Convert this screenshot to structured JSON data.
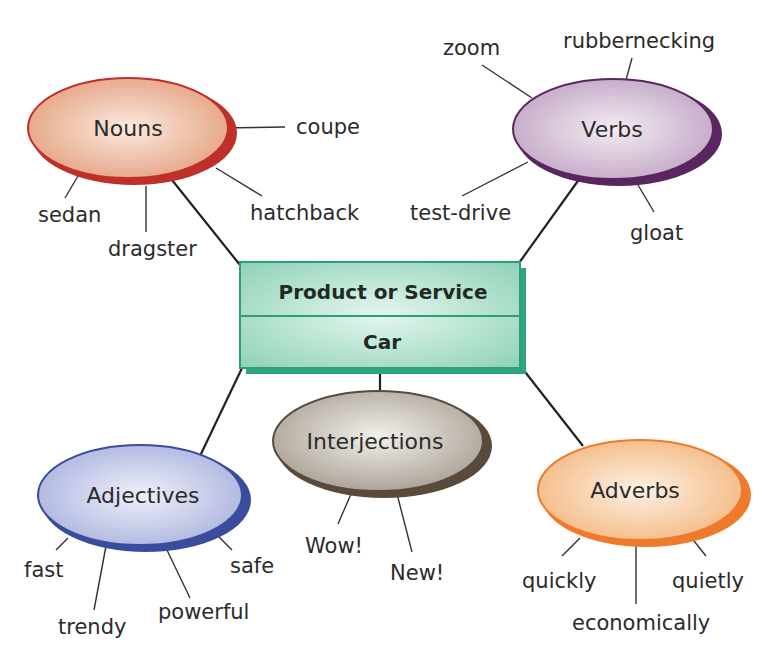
{
  "center": {
    "title": "Product or Service",
    "value": "Car",
    "colors": {
      "fill": "#a6dcc6",
      "border": "#2e9e78",
      "shadow": "#2ea57e"
    }
  },
  "categories": {
    "nouns": {
      "label": "Nouns",
      "colors": {
        "fill": "#eab296",
        "border": "#c0302a"
      },
      "words": [
        "coupe",
        "sedan",
        "dragster",
        "hatchback"
      ]
    },
    "verbs": {
      "label": "Verbs",
      "colors": {
        "fill": "#d0bcd2",
        "border": "#5a2660"
      },
      "words": [
        "zoom",
        "rubbernecking",
        "test-drive",
        "gloat"
      ]
    },
    "interjections": {
      "label": "Interjections",
      "colors": {
        "fill": "#c9c2b8",
        "border": "#5a4a3c"
      },
      "words": [
        "Wow!",
        "New!"
      ]
    },
    "adjectives": {
      "label": "Adjectives",
      "colors": {
        "fill": "#bcc3e4",
        "border": "#3a4d9c"
      },
      "words": [
        "fast",
        "trendy",
        "powerful",
        "safe"
      ]
    },
    "adverbs": {
      "label": "Adverbs",
      "colors": {
        "fill": "#f6cca2",
        "border": "#ef7a2c"
      },
      "words": [
        "quickly",
        "economically",
        "quietly"
      ]
    }
  }
}
